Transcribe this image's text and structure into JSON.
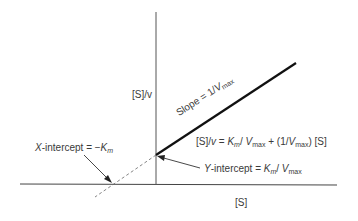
{
  "diagram": {
    "y_axis_label": "[S]/v",
    "x_axis_label": "[S]",
    "slope_label": {
      "prefix": "Slope = 1/",
      "var": "V",
      "sub": "max"
    },
    "equation": {
      "lhs": "[S]/",
      "lhs_var": "v",
      "eq": " = ",
      "km": "K",
      "km_sub": "m",
      "div": "/ ",
      "vmax": "V",
      "vmax_sub": "max",
      "plus": " + (1/",
      "vmax2": "V",
      "vmax2_sub": "max",
      "tail": ") [S]"
    },
    "x_intercept_label": {
      "var": "X",
      "text": "-intercept = −",
      "km": "K",
      "km_sub": "m"
    },
    "y_intercept_label": {
      "var": "Y",
      "text": "-intercept = ",
      "km": "K",
      "km_sub": "m",
      "div": "/ ",
      "vmax": "V",
      "vmax_sub": "max"
    },
    "colors": {
      "line": "#111111",
      "axis": "#444444",
      "dashed": "#666666",
      "text": "#3a3a3a"
    }
  }
}
